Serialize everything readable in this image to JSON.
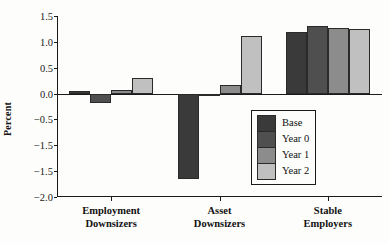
{
  "chart_data": {
    "type": "bar",
    "title": "",
    "xlabel": "",
    "ylabel": "Percent",
    "ylim": [
      -2.0,
      1.5
    ],
    "grid": false,
    "legend_position": "lower-right",
    "categories": [
      "Employment Downsizers",
      "Asset Downsizers",
      "Stable Employers"
    ],
    "category_lines": [
      [
        "Employment",
        "Downsizers"
      ],
      [
        "Asset",
        "Downsizers"
      ],
      [
        "Stable",
        "Employers"
      ]
    ],
    "ytick_labels": [
      "1.5",
      "1.0",
      "0.5",
      "0.0",
      "-0.5",
      "-1.5",
      "-1.5",
      "-2.0"
    ],
    "ytick_values": [
      1.5,
      1.0,
      0.5,
      0.0,
      -0.5,
      -1.0,
      -1.5,
      -2.0
    ],
    "series": [
      {
        "name": "Base",
        "color": "#3a3a3a",
        "values": [
          0.05,
          -1.65,
          1.19
        ]
      },
      {
        "name": "Year 0",
        "color": "#4f4f4f",
        "values": [
          -0.18,
          -0.03,
          1.3
        ]
      },
      {
        "name": "Year 1",
        "color": "#8c8c8c",
        "values": [
          0.07,
          0.17,
          1.27
        ]
      },
      {
        "name": "Year 2",
        "color": "#c0c0c0",
        "values": [
          0.31,
          1.11,
          1.25
        ]
      }
    ]
  },
  "legend": {
    "entries": [
      {
        "label": "Base",
        "color": "#3a3a3a"
      },
      {
        "label": "Year 0",
        "color": "#4f4f4f"
      },
      {
        "label": "Year 1",
        "color": "#8c8c8c"
      },
      {
        "label": "Year 2",
        "color": "#c0c0c0"
      }
    ]
  },
  "axis": {
    "y_title": "Percent"
  }
}
